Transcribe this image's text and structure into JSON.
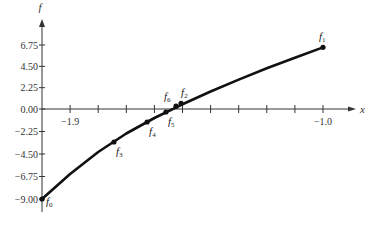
{
  "chart_data": {
    "type": "line",
    "title": "",
    "xlabel": "x",
    "ylabel": "f",
    "xlim": [
      -2.0,
      -0.88
    ],
    "ylim": [
      -10.2,
      8.9
    ],
    "grid": false,
    "legend": null,
    "x_ticks": [
      -1.9,
      -1.8,
      -1.7,
      -1.6,
      -1.5,
      -1.4,
      -1.3,
      -1.2,
      -1.1,
      -1.0
    ],
    "x_tick_labels": [
      {
        "value": -1.9,
        "label": "−1.9"
      },
      {
        "value": -1.0,
        "label": "−1.0"
      }
    ],
    "y_ticks": [
      6.75,
      4.5,
      2.25,
      0.0,
      -2.25,
      -4.5,
      -6.75,
      -9.0
    ],
    "y_tick_labels": [
      "6.75",
      "4.50",
      "2.25",
      "0.00",
      "−2.25",
      "−4.50",
      "−6.75",
      "−9.00"
    ],
    "series": [
      {
        "name": "f(x)",
        "style": "thick solid curve",
        "x": [
          -2.0,
          -1.9,
          -1.8,
          -1.7,
          -1.6,
          -1.5,
          -1.4,
          -1.3,
          -1.2,
          -1.1,
          -1.0
        ],
        "y": [
          -9.0,
          -6.5,
          -4.3,
          -2.45,
          -0.9,
          0.5,
          1.85,
          3.1,
          4.3,
          5.4,
          6.5
        ]
      }
    ],
    "points": [
      {
        "name": "f0",
        "base": "f",
        "sub": "0",
        "x": -2.0,
        "y": -9.0,
        "label_pos": "right"
      },
      {
        "name": "f1",
        "base": "f",
        "sub": "1",
        "x": -1.0,
        "y": 6.5,
        "label_pos": "above"
      },
      {
        "name": "f2",
        "base": "f",
        "sub": "2",
        "x": -1.505,
        "y": 0.6,
        "label_pos": "above-right"
      },
      {
        "name": "f3",
        "base": "f",
        "sub": "3",
        "x": -1.744,
        "y": -3.3,
        "label_pos": "below-right"
      },
      {
        "name": "f4",
        "base": "f",
        "sub": "4",
        "x": -1.626,
        "y": -1.3,
        "label_pos": "below-right"
      },
      {
        "name": "f5",
        "base": "f",
        "sub": "5",
        "x": -1.559,
        "y": -0.3,
        "label_pos": "below-right"
      },
      {
        "name": "f6",
        "base": "f",
        "sub": "6",
        "x": -1.523,
        "y": 0.3,
        "label_pos": "above-left"
      }
    ]
  },
  "colors": {
    "curve": "#111111",
    "axis": "#333333",
    "text": "#333333"
  }
}
